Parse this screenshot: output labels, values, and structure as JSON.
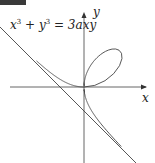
{
  "figure": {
    "badge": {
      "color": "#3a3a3a",
      "text": ""
    },
    "equation": {
      "lhs_x": "x",
      "exp1": "3",
      "plus": " + ",
      "lhs_y": "y",
      "exp2": "3",
      "rhs": " = 3axy"
    },
    "axes": {
      "x_label": "x",
      "y_label": "y"
    },
    "curve": {
      "name": "Folium of Descartes",
      "a_px": 24,
      "color": "#444444"
    },
    "asymptote": {
      "equation": "x + y + a = 0",
      "color": "#444444"
    },
    "origin_px": [
      84,
      87
    ]
  }
}
